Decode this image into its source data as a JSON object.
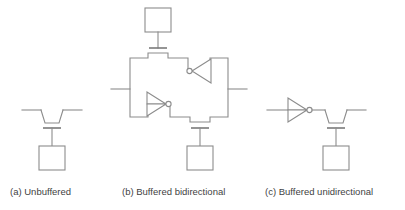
{
  "figure": {
    "background_color": "#ffffff",
    "line_color": "#8c8c8c",
    "text_color": "#3f3f3f"
  },
  "captions": {
    "a": "(a) Unbuffered",
    "b": "(b) Buffered bidirectional",
    "c": "(c) Buffered unidirectional"
  },
  "panels": [
    {
      "id": "a",
      "label": "(a) Unbuffered",
      "components": [
        "signal-wire-left",
        "signal-wire-right",
        "transistor-channel",
        "transistor-gate-bar",
        "gate-connection-wire",
        "bond-pad"
      ],
      "inverter_count": 0,
      "bond_pad_count": 1,
      "transistor_count": 1
    },
    {
      "id": "b",
      "label": "(b) Buffered bidirectional",
      "components": [
        "top-bond-pad",
        "top-gate-wire",
        "top-transistor-gate-bar",
        "ring-conductor",
        "inverter-top-right-to-left",
        "inverter-bottom-left-to-right",
        "signal-wire-left",
        "signal-wire-right",
        "bottom-transistor-gate-bar",
        "bottom-gate-wire",
        "bottom-bond-pad"
      ],
      "inverter_count": 2,
      "bond_pad_count": 2,
      "transistor_count": 2
    },
    {
      "id": "c",
      "label": "(c) Buffered unidirectional",
      "components": [
        "signal-wire-left",
        "inverter",
        "signal-wire-right",
        "transistor-channel",
        "transistor-gate-bar",
        "gate-connection-wire",
        "bond-pad"
      ],
      "inverter_count": 1,
      "bond_pad_count": 1,
      "transistor_count": 1
    }
  ]
}
